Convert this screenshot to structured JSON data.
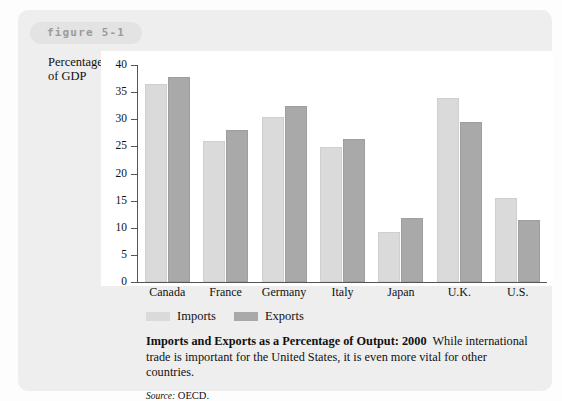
{
  "figure": {
    "badge_label": "figure 5-1"
  },
  "chart_data": {
    "type": "bar",
    "title": "Imports and Exports as a Percentage of Output: 2000",
    "xlabel": "",
    "ylabel": "Percentage of GDP",
    "ylim": [
      0,
      40
    ],
    "yticks": [
      40,
      35,
      30,
      25,
      20,
      15,
      10,
      5,
      0
    ],
    "grid": false,
    "legend_position": "bottom-left",
    "categories": [
      "Canada",
      "France",
      "Germany",
      "Italy",
      "Japan",
      "U.K.",
      "U.S."
    ],
    "series": [
      {
        "name": "Imports",
        "color": "#dadada",
        "values": [
          36.5,
          26.0,
          30.5,
          24.8,
          9.2,
          34.0,
          15.5
        ]
      },
      {
        "name": "Exports",
        "color": "#a9a9a9",
        "values": [
          37.8,
          28.0,
          32.5,
          26.3,
          11.8,
          29.5,
          11.5
        ]
      }
    ]
  },
  "caption": {
    "title": "Imports and Exports as a Percentage of Output: 2000",
    "body": "While international trade is important for the United States, it is even more vital for other countries.",
    "source_label": "Source:",
    "source_value": "OECD."
  }
}
